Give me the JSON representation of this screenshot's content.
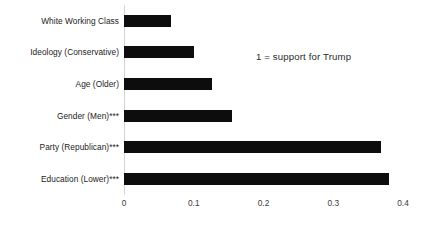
{
  "chart_data": {
    "type": "bar",
    "orientation": "horizontal",
    "title": "",
    "subtitle": "",
    "xlabel": "",
    "ylabel": "",
    "xlim": [
      0,
      0.4
    ],
    "xticks": [
      "0",
      "0.1",
      "0.2",
      "0.3",
      "0.4"
    ],
    "xtick_values": [
      0,
      0.1,
      0.2,
      0.3,
      0.4
    ],
    "grid": false,
    "legend": null,
    "categories": [
      "White Working Class",
      "Ideology (Conservative)",
      "Age (Older)",
      "Gender (Men)***",
      "Party (Republican)***",
      "Education (Lower)***"
    ],
    "values": [
      0.068,
      0.1,
      0.126,
      0.155,
      0.368,
      0.38
    ],
    "series": [
      {
        "name": "coefficient",
        "values": [
          0.068,
          0.1,
          0.126,
          0.155,
          0.368,
          0.38
        ]
      }
    ],
    "annotations": [
      {
        "text": "1 = support for Trump",
        "x": 0.19,
        "y": 1
      }
    ],
    "bar_color": "#0d0d0d",
    "axis_color": "#d4d4d4",
    "background_color": "#ffffff"
  }
}
